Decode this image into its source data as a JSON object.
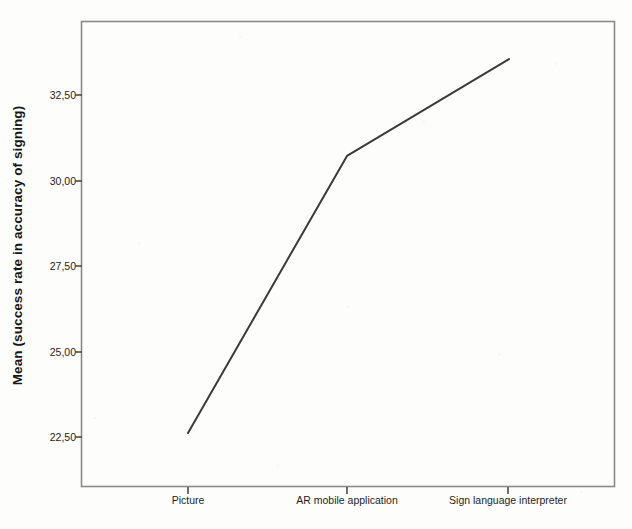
{
  "chart_data": {
    "type": "line",
    "title": "",
    "xlabel": "",
    "ylabel": "Mean (success rate in accuracy of signing)",
    "categories": [
      "Picture",
      "AR mobile application",
      "Sign language interpreter"
    ],
    "values": [
      22.62,
      30.72,
      33.55
    ],
    "series": [
      {
        "name": "Mean success rate in accuracy of signing",
        "values": [
          22.62,
          30.72,
          33.55
        ]
      }
    ],
    "ylim": [
      21.4,
      34.7
    ],
    "yticks": [
      22.5,
      25.0,
      27.5,
      30.0,
      32.5
    ],
    "ytick_labels": [
      "22,50",
      "25,00",
      "27,50",
      "30,00",
      "32,50"
    ],
    "xtick_labels": [
      "Picture",
      "AR mobile application",
      "Sign language interpreter"
    ],
    "grid": false,
    "legend": false,
    "legend_position": "none",
    "decimal_separator": ",",
    "line_color": "#3a3a3a",
    "axis_color": "#6e6e6e",
    "background_color": "#fdfdfc",
    "text_color": "#1d1d1d"
  },
  "axes": {
    "y_label": "Mean (success rate in accuracy of signing)",
    "y_tick_labels": [
      "32,50",
      "30,00",
      "27,50",
      "25,00",
      "22,50"
    ],
    "x_tick_labels": [
      "Picture",
      "AR mobile application",
      "Sign language interpreter"
    ]
  }
}
